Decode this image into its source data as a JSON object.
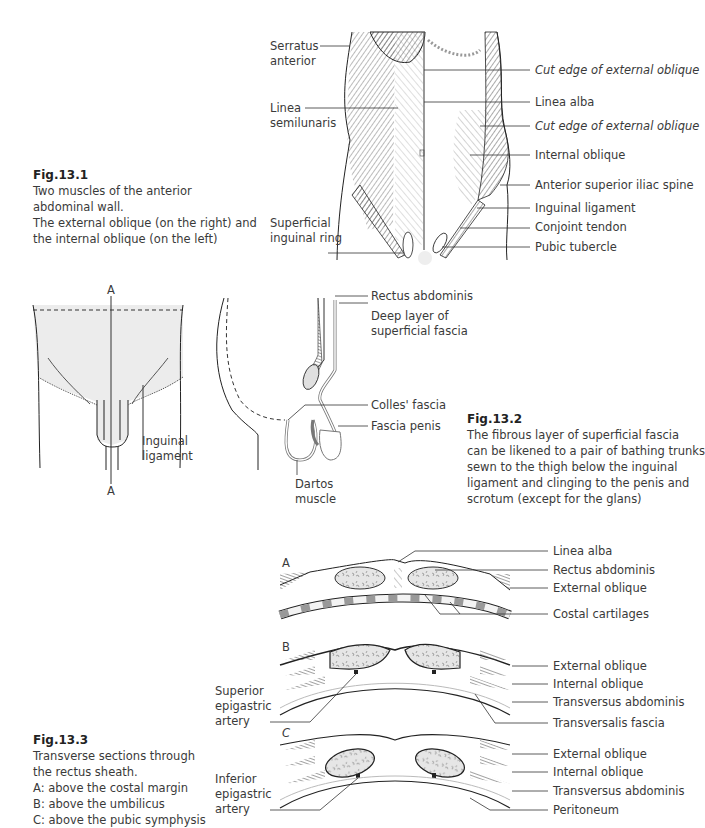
{
  "fig1": {
    "title": "Fig.13.1",
    "caption_lines": [
      "Two muscles of the anterior",
      "abdominal wall.",
      "The external oblique (on the right) and",
      "the internal oblique (on the left)"
    ],
    "labels_left": [
      "Serratus",
      "anterior",
      "Linea",
      "semilunaris",
      "Superficial",
      "inguinal ring"
    ],
    "labels_right": [
      "Cut edge of external oblique",
      "Linea alba",
      "Cut edge of external oblique",
      "Internal oblique",
      "Anterior superior iliac spine",
      "Inguinal ligament",
      "Conjoint tendon",
      "Pubic tubercle"
    ]
  },
  "fig2": {
    "title": "Fig.13.2",
    "caption_lines": [
      "The fibrous layer of superficial fascia",
      "can be likened to a pair of bathing trunks",
      "sewn to the thigh below the inguinal",
      "ligament and clinging to the penis and",
      "scrotum (except for the glans)"
    ],
    "front_labels": {
      "top_marker": "A",
      "bottom_marker": "A",
      "inguinal_1": "Inguinal",
      "inguinal_2": "ligament"
    },
    "side_labels": [
      "Rectus abdominis",
      "Deep layer of",
      "superficial fascia",
      "Colles' fascia",
      "Fascia penis",
      "Dartos",
      "muscle"
    ]
  },
  "fig3": {
    "title": "Fig.13.3",
    "caption_lines": [
      "Transverse sections through",
      "the rectus sheath.",
      "A: above the costal margin",
      "B: above the umbilicus",
      "C: above the pubic symphysis"
    ],
    "section_markers": [
      "A",
      "B",
      "C"
    ],
    "section_a_labels": [
      "Linea alba",
      "Rectus abdominis",
      "External oblique",
      "Costal cartilages"
    ],
    "section_b_labels": [
      "External oblique",
      "Internal oblique",
      "Transversus abdominis",
      "Transversalis fascia"
    ],
    "section_b_left": [
      "Superior",
      "epigastric",
      "artery"
    ],
    "section_c_labels": [
      "External oblique",
      "Internal oblique",
      "Transversus abdominis",
      "Peritoneum"
    ],
    "section_c_left": [
      "Inferior",
      "epigastric",
      "artery"
    ]
  }
}
